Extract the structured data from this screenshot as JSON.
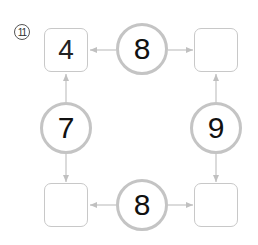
{
  "problem": {
    "number": "11"
  },
  "boxes": {
    "top_left": "4",
    "top_right": "",
    "bottom_left": "",
    "bottom_right": ""
  },
  "circles": {
    "top": "8",
    "left": "7",
    "right": "9",
    "bottom": "8"
  },
  "colors": {
    "line": "#c8c8c8",
    "circle_border": "#c4c4c4",
    "text": "#111111"
  }
}
